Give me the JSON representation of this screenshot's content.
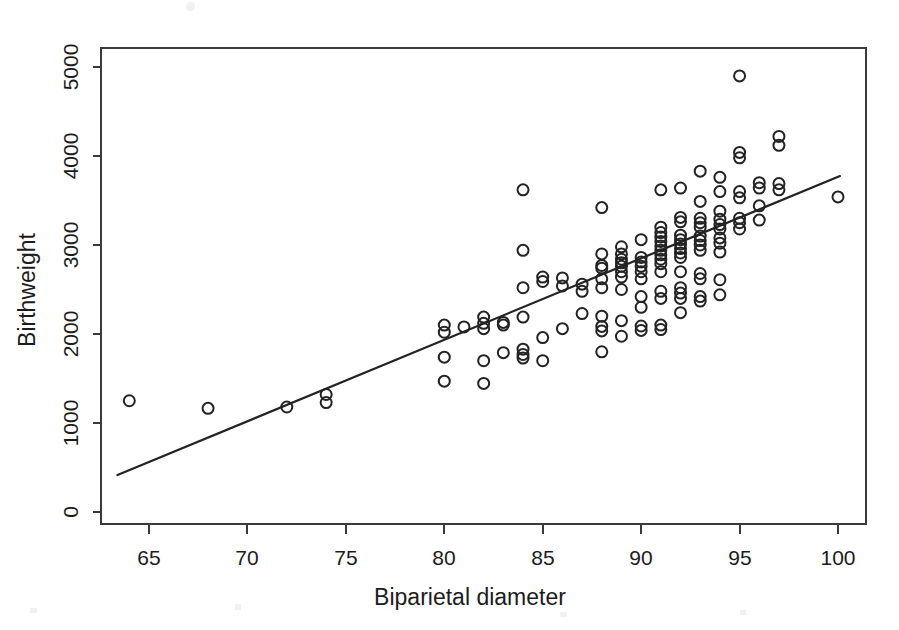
{
  "figure": {
    "type": "scatter-with-regression-line",
    "background_color": "#ffffff",
    "ink_color": "#232323",
    "width": 899,
    "height": 630
  },
  "chart_data": {
    "type": "scatter",
    "title": "",
    "xlabel": "Biparietal diameter",
    "ylabel": "Birthweight",
    "xlim": [
      62.5,
      101.5
    ],
    "ylim": [
      0,
      5250
    ],
    "xticks": [
      65,
      70,
      75,
      80,
      85,
      90,
      95,
      100
    ],
    "yticks": [
      0,
      1000,
      2000,
      3000,
      4000,
      5000
    ],
    "xtick_labels": [
      "65",
      "70",
      "75",
      "80",
      "85",
      "90",
      "95",
      "100"
    ],
    "ytick_labels": [
      "0",
      "1000",
      "2000",
      "3000",
      "4000",
      "5000"
    ],
    "grid": false,
    "legend": false,
    "marker": "open-circle",
    "marker_radius_px": 5.5,
    "fit_line": {
      "label": "least-squares regression line",
      "x_start": 63.4,
      "y_start": 415,
      "x_end": 100.1,
      "y_end": 3775
    },
    "points": [
      [
        64,
        1250
      ],
      [
        68,
        1165
      ],
      [
        72,
        1180
      ],
      [
        74,
        1320
      ],
      [
        74,
        1230
      ],
      [
        80,
        2100
      ],
      [
        80,
        2020
      ],
      [
        80,
        1740
      ],
      [
        80,
        1470
      ],
      [
        81,
        2080
      ],
      [
        82,
        2190
      ],
      [
        82,
        2120
      ],
      [
        82,
        2060
      ],
      [
        82,
        1700
      ],
      [
        82,
        1445
      ],
      [
        83,
        2130
      ],
      [
        83,
        2100
      ],
      [
        83,
        1790
      ],
      [
        84,
        3620
      ],
      [
        84,
        2940
      ],
      [
        84,
        2520
      ],
      [
        84,
        2190
      ],
      [
        84,
        1830
      ],
      [
        84,
        1770
      ],
      [
        84,
        1730
      ],
      [
        85,
        2640
      ],
      [
        85,
        2590
      ],
      [
        85,
        1960
      ],
      [
        85,
        1700
      ],
      [
        86,
        2630
      ],
      [
        86,
        2540
      ],
      [
        86,
        2060
      ],
      [
        87,
        2560
      ],
      [
        87,
        2480
      ],
      [
        87,
        2230
      ],
      [
        88,
        3420
      ],
      [
        88,
        2900
      ],
      [
        88,
        2770
      ],
      [
        88,
        2740
      ],
      [
        88,
        2620
      ],
      [
        88,
        2520
      ],
      [
        88,
        2200
      ],
      [
        88,
        2085
      ],
      [
        88,
        2035
      ],
      [
        88,
        1800
      ],
      [
        89,
        2980
      ],
      [
        89,
        2900
      ],
      [
        89,
        2840
      ],
      [
        89,
        2800
      ],
      [
        89,
        2760
      ],
      [
        89,
        2700
      ],
      [
        89,
        2640
      ],
      [
        89,
        2500
      ],
      [
        89,
        2150
      ],
      [
        89,
        1975
      ],
      [
        90,
        3060
      ],
      [
        90,
        2860
      ],
      [
        90,
        2810
      ],
      [
        90,
        2760
      ],
      [
        90,
        2700
      ],
      [
        90,
        2620
      ],
      [
        90,
        2420
      ],
      [
        90,
        2300
      ],
      [
        90,
        2090
      ],
      [
        90,
        2040
      ],
      [
        91,
        3620
      ],
      [
        91,
        3200
      ],
      [
        91,
        3140
      ],
      [
        91,
        3090
      ],
      [
        91,
        3040
      ],
      [
        91,
        2990
      ],
      [
        91,
        2940
      ],
      [
        91,
        2890
      ],
      [
        91,
        2840
      ],
      [
        91,
        2790
      ],
      [
        91,
        2700
      ],
      [
        91,
        2480
      ],
      [
        91,
        2400
      ],
      [
        91,
        2100
      ],
      [
        91,
        2050
      ],
      [
        92,
        3640
      ],
      [
        92,
        3310
      ],
      [
        92,
        3260
      ],
      [
        92,
        3110
      ],
      [
        92,
        3060
      ],
      [
        92,
        3010
      ],
      [
        92,
        2960
      ],
      [
        92,
        2910
      ],
      [
        92,
        2860
      ],
      [
        92,
        2700
      ],
      [
        92,
        2520
      ],
      [
        92,
        2460
      ],
      [
        92,
        2400
      ],
      [
        92,
        2240
      ],
      [
        93,
        3830
      ],
      [
        93,
        3490
      ],
      [
        93,
        3300
      ],
      [
        93,
        3250
      ],
      [
        93,
        3200
      ],
      [
        93,
        3100
      ],
      [
        93,
        3050
      ],
      [
        93,
        3000
      ],
      [
        93,
        2940
      ],
      [
        93,
        2680
      ],
      [
        93,
        2620
      ],
      [
        93,
        2420
      ],
      [
        93,
        2370
      ],
      [
        94,
        3760
      ],
      [
        94,
        3600
      ],
      [
        94,
        3380
      ],
      [
        94,
        3290
      ],
      [
        94,
        3230
      ],
      [
        94,
        3180
      ],
      [
        94,
        3080
      ],
      [
        94,
        3020
      ],
      [
        94,
        2920
      ],
      [
        94,
        2610
      ],
      [
        94,
        2440
      ],
      [
        95,
        4900
      ],
      [
        95,
        4040
      ],
      [
        95,
        3980
      ],
      [
        95,
        3600
      ],
      [
        95,
        3530
      ],
      [
        95,
        3300
      ],
      [
        95,
        3250
      ],
      [
        95,
        3180
      ],
      [
        96,
        3700
      ],
      [
        96,
        3640
      ],
      [
        96,
        3440
      ],
      [
        96,
        3280
      ],
      [
        97,
        4220
      ],
      [
        97,
        4120
      ],
      [
        97,
        3690
      ],
      [
        97,
        3620
      ],
      [
        100,
        3540
      ]
    ]
  },
  "axes": {
    "y_axis_title": "Birthweight",
    "x_axis_title": "Biparietal diameter"
  }
}
